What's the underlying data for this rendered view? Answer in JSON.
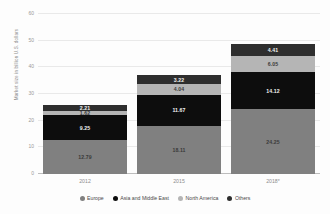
{
  "chart_data": {
    "type": "bar",
    "subtype": "stacked-bar",
    "title": "",
    "xlabel": "",
    "ylabel": "Market size in billion U.S. dollars",
    "categories": [
      "2012",
      "2015",
      "2018*"
    ],
    "ylim": [
      0,
      60
    ],
    "yticks": [
      0,
      10,
      20,
      30,
      40,
      50,
      60
    ],
    "ytick_labels": [
      "0",
      "10",
      "20",
      "30",
      "40",
      "50",
      "60"
    ],
    "grid": true,
    "legend_position": "bottom",
    "series": [
      {
        "name": "Europe",
        "color": "#808080",
        "label_tone": "light",
        "values": [
          12.79,
          18.11,
          24.25
        ],
        "value_labels": [
          "12.79",
          "18.11",
          "24.25"
        ]
      },
      {
        "name": "Asia and Middle East",
        "color": "#0d0d0d",
        "label_tone": "dark",
        "values": [
          9.25,
          11.67,
          14.12
        ],
        "value_labels": [
          "9.25",
          "11.67",
          "14.12"
        ]
      },
      {
        "name": "North America",
        "color": "#b5b5b5",
        "label_tone": "light",
        "values": [
          1.62,
          4.04,
          6.05
        ],
        "value_labels": [
          "1.62",
          "4.04",
          "6.05"
        ]
      },
      {
        "name": "Others",
        "color": "#2e2e2e",
        "label_tone": "dark",
        "values": [
          2.21,
          3.22,
          4.41
        ],
        "value_labels": [
          "2.21",
          "3.22",
          "4.41"
        ]
      }
    ],
    "totals": [
      25.87,
      37.04,
      48.83
    ]
  }
}
